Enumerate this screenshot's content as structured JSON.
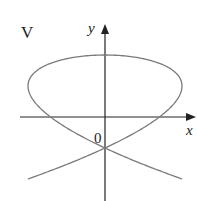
{
  "figure": {
    "panel_label": "V",
    "x_axis_label": "x",
    "y_axis_label": "y",
    "origin_label": "0",
    "curve": "Lissajous curve, x = sin(3t + pi/4), y = sin(2t)",
    "stroke_color": "#7a7a7a",
    "axis_color": "#222222"
  }
}
